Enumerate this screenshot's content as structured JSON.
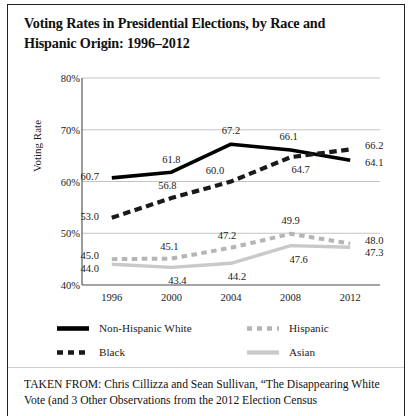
{
  "figure": {
    "title": "Voting Rates in Presidential Elections, by Race and Hispanic Origin: 1996–2012",
    "caption": "TAKEN FROM: Chris Cillizza and Sean Sullivan, “The Disappearing White Vote (and 3 Other Observations from the 2012 Election Census"
  },
  "chart_data": {
    "type": "line",
    "title": "Voting Rates in Presidential Elections, by Race and Hispanic Origin: 1996–2012",
    "xlabel": "",
    "ylabel": "Voting Rate",
    "x": [
      "1996",
      "2000",
      "2004",
      "2008",
      "2012"
    ],
    "categories": [
      "1996",
      "2000",
      "2004",
      "2008",
      "2012"
    ],
    "ylim": [
      40,
      80
    ],
    "yticks": [
      "40%",
      "50%",
      "60%",
      "70%",
      "80%"
    ],
    "ytick_values": [
      40,
      50,
      60,
      70,
      80
    ],
    "grid": true,
    "legend_position": "bottom",
    "series": [
      {
        "name": "Non-Hispanic White",
        "style": "solid",
        "color": "#000000",
        "values": [
          60.7,
          61.8,
          67.2,
          66.1,
          64.1
        ],
        "labels": [
          "60.7",
          "61.8",
          "67.2",
          "66.1",
          "64.1"
        ]
      },
      {
        "name": "Black",
        "style": "dashed",
        "color": "#1a1a1a",
        "values": [
          53.0,
          56.8,
          60.0,
          64.7,
          66.2
        ],
        "labels": [
          "53.0",
          "56.8",
          "60.0",
          "64.7",
          "66.2"
        ]
      },
      {
        "name": "Hispanic",
        "style": "dashed",
        "color": "#b5b5b5",
        "values": [
          45.0,
          45.1,
          47.2,
          49.9,
          48.0
        ],
        "labels": [
          "45.0",
          "45.1",
          "47.2",
          "49.9",
          "48.0"
        ]
      },
      {
        "name": "Asian",
        "style": "solid",
        "color": "#c9c9c9",
        "values": [
          44.0,
          43.4,
          44.2,
          47.6,
          47.3
        ],
        "labels": [
          "44.0",
          "43.4",
          "44.2",
          "47.6",
          "47.3"
        ]
      }
    ]
  },
  "legend": {
    "items": [
      {
        "label": "Non-Hispanic White"
      },
      {
        "label": "Hispanic"
      },
      {
        "label": "Black"
      },
      {
        "label": "Asian"
      }
    ]
  }
}
